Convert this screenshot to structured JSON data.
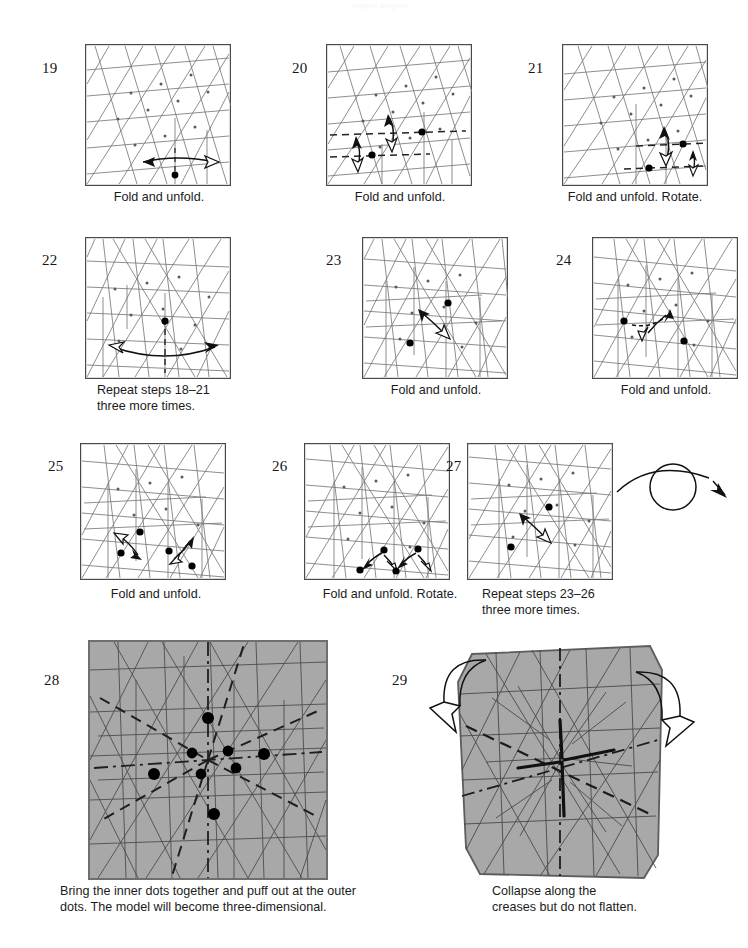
{
  "document": {
    "kind": "origami-folding-diagram",
    "faint_header": "origami diagram"
  },
  "colors": {
    "paper_shaded": "#a8a8a8",
    "crease_line": "#6e6e6e",
    "crease_line_dark": "#3a3a3a",
    "border": "#4a4a4a",
    "dot": "#000000",
    "text": "#1b1b1b",
    "background": "#ffffff"
  },
  "steps": [
    {
      "number": "19",
      "caption": "Fold and unfold.",
      "shaded": false,
      "arrows": "horizontal fold-and-unfold arrow",
      "dots": 1,
      "rotate_symbol": false
    },
    {
      "number": "20",
      "caption": "Fold and unfold.",
      "shaded": false,
      "arrows": "two vertical fold-and-unfold arrows on dashed crease lines",
      "dots": 2,
      "rotate_symbol": false
    },
    {
      "number": "21",
      "caption": "Fold and unfold. Rotate.",
      "shaded": false,
      "arrows": "two vertical fold-and-unfold arrows on dashed crease lines",
      "dots": 2,
      "rotate_symbol": false
    },
    {
      "number": "22",
      "caption": "Repeat steps 18–21\nthree more times.",
      "shaded": false,
      "arrows": "wide horizontal fold-and-unfold arrow",
      "dots": 1,
      "rotate_symbol": false
    },
    {
      "number": "23",
      "caption": "Fold and unfold.",
      "shaded": false,
      "arrows": "diagonal fold-and-unfold arrow",
      "dots": 2,
      "rotate_symbol": false
    },
    {
      "number": "24",
      "caption": "Fold and unfold.",
      "shaded": false,
      "arrows": "diagonal fold-and-unfold arrow",
      "dots": 2,
      "rotate_symbol": false
    },
    {
      "number": "25",
      "caption": "Fold and unfold.",
      "shaded": false,
      "arrows": "two pairs of diagonal fold-and-unfold arrows",
      "dots": 4,
      "rotate_symbol": false
    },
    {
      "number": "26",
      "caption": "Fold and unfold. Rotate.",
      "shaded": false,
      "arrows": "two pairs of diagonal fold-and-unfold arrows",
      "dots": 4,
      "rotate_symbol": false
    },
    {
      "number": "27",
      "caption": "Repeat steps 23–26\nthree more times.",
      "shaded": false,
      "arrows": "diagonal fold-and-unfold arrow",
      "dots": 2,
      "rotate_symbol": true
    },
    {
      "number": "28",
      "caption": "Bring the inner dots together and puff out at the outer\ndots. The model will become three-dimensional.",
      "shaded": true,
      "arrows": "none",
      "dots": 9,
      "rotate_symbol": false
    },
    {
      "number": "29",
      "caption": "Collapse along the\ncreases but do not flatten.",
      "shaded": true,
      "arrows": "two outward collapse arrows, left and right",
      "dots": 0,
      "rotate_symbol": false
    }
  ],
  "symbols": {
    "turn_over": "turn-over-symbol",
    "fold_unfold_arrow": "fold-and-unfold-arrow",
    "valley_fold_line": "dashed",
    "mountain_fold_line": "dash-dot"
  }
}
